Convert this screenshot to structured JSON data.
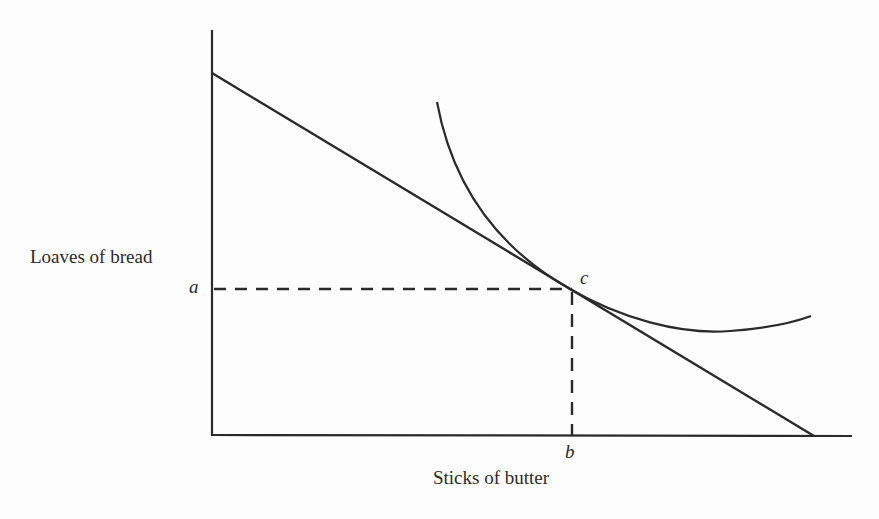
{
  "diagram": {
    "type": "indifference-curve-budget-line",
    "y_axis_label": "Loaves of bread",
    "x_axis_label": "Sticks of butter",
    "point_labels": {
      "y_value": "a",
      "x_value": "b",
      "tangency": "c"
    },
    "elements": [
      {
        "name": "budget-line",
        "from": [
          212,
          73
        ],
        "to": [
          812,
          436
        ]
      },
      {
        "name": "indifference-curve",
        "start": [
          437,
          102
        ],
        "tangent_at": [
          570,
          289
        ],
        "end": [
          811,
          317
        ]
      },
      {
        "name": "dashed-guide-horizontal",
        "from": "a",
        "to": "c"
      },
      {
        "name": "dashed-guide-vertical",
        "from": "c",
        "to": "b"
      }
    ],
    "colors": {
      "line": "#2a2a2a",
      "background": "#fdfdfd"
    }
  }
}
